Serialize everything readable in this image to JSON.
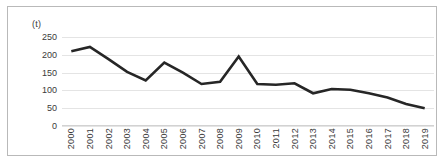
{
  "chart_data": {
    "type": "line",
    "title": "",
    "subtitle": "",
    "unit_label": "(t)",
    "xlabel": "",
    "ylabel": "",
    "ylim": [
      0,
      250
    ],
    "yticks": [
      0,
      50,
      100,
      150,
      200,
      250
    ],
    "grid": true,
    "legend": false,
    "legend_position": "none",
    "x_tick_rotation": 90,
    "line_color": "#262626",
    "grid_color": "#e4e4e4",
    "categories": [
      "2000",
      "2001",
      "2002",
      "2003",
      "2004",
      "2005",
      "2006",
      "2007",
      "2008",
      "2009",
      "2010",
      "2011",
      "2012",
      "2013",
      "2014",
      "2015",
      "2016",
      "2017",
      "2018",
      "2019"
    ],
    "values": [
      210,
      222,
      188,
      152,
      128,
      178,
      150,
      118,
      124,
      195,
      118,
      116,
      120,
      92,
      104,
      102,
      92,
      80,
      62,
      50
    ],
    "annotations": []
  }
}
